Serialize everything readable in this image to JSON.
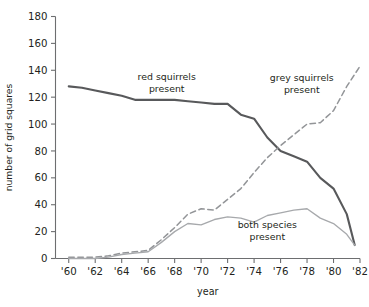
{
  "chart_data": {
    "type": "line",
    "title": "",
    "xlabel": "year",
    "ylabel": "number of grid squares",
    "xlim": [
      1959,
      1982
    ],
    "ylim": [
      0,
      180
    ],
    "grid": false,
    "legend_position": "inline-annotations",
    "x_tick_labels": [
      "'60",
      "'62",
      "'64",
      "'66",
      "'68",
      "'70",
      "'72",
      "'74",
      "'76",
      "'78",
      "'80",
      "'82"
    ],
    "x_tick_values": [
      1960,
      1962,
      1964,
      1966,
      1968,
      1970,
      1972,
      1974,
      1976,
      1978,
      1980,
      1982
    ],
    "y_tick_labels": [
      "0",
      "20",
      "40",
      "60",
      "80",
      "100",
      "120",
      "140",
      "160",
      "180"
    ],
    "y_tick_values": [
      0,
      20,
      40,
      60,
      80,
      100,
      120,
      140,
      160,
      180
    ],
    "series": [
      {
        "name": "red squirrels present",
        "style": "solid",
        "color": "#58595b",
        "x": [
          1960,
          1961,
          1962,
          1963,
          1964,
          1965,
          1966,
          1967,
          1968,
          1969,
          1970,
          1971,
          1972,
          1973,
          1974,
          1975,
          1976,
          1977,
          1978,
          1979,
          1980,
          1981,
          1981.6
        ],
        "values": [
          128,
          127,
          125,
          123,
          121,
          118,
          118,
          118,
          118,
          117,
          116,
          115,
          115,
          107,
          104,
          90,
          80,
          76,
          72,
          60,
          52,
          33,
          10
        ]
      },
      {
        "name": "grey squirrels present",
        "style": "dashed",
        "color": "#939598",
        "x": [
          1960,
          1962,
          1963,
          1964,
          1965,
          1966,
          1967,
          1968,
          1969,
          1970,
          1971,
          1972,
          1973,
          1974,
          1975,
          1976,
          1977,
          1978,
          1979,
          1980,
          1981,
          1982
        ],
        "values": [
          1,
          1,
          2,
          4,
          5,
          6,
          14,
          23,
          33,
          37,
          36,
          44,
          52,
          64,
          75,
          84,
          92,
          100,
          101,
          110,
          128,
          143
        ]
      },
      {
        "name": "both species present",
        "style": "solid",
        "color": "#a7a9ac",
        "x": [
          1960,
          1962,
          1963,
          1964,
          1965,
          1966,
          1967,
          1968,
          1969,
          1970,
          1971,
          1972,
          1973,
          1974,
          1975,
          1976,
          1977,
          1978,
          1979,
          1980,
          1981,
          1981.6
        ],
        "values": [
          0,
          0,
          1,
          3,
          4,
          5,
          12,
          20,
          26,
          25,
          29,
          31,
          30,
          27,
          32,
          34,
          36,
          37,
          30,
          26,
          18,
          10
        ]
      }
    ],
    "annotations": [
      {
        "label_line1": "red squirrels",
        "label_line2": "present",
        "x": 1967.4,
        "y": 133
      },
      {
        "label_line1": "grey squirrels",
        "label_line2": "present",
        "x": 1977.6,
        "y": 132
      },
      {
        "label_line1": "both species",
        "label_line2": "present",
        "x": 1975.0,
        "y": 23
      }
    ]
  },
  "axis": {
    "y_title": "number of grid squares",
    "x_title": "year"
  },
  "colors": {
    "red_series": "#58595b",
    "grey_series": "#939598",
    "both_series": "#a7a9ac",
    "axis": "#6d6e70",
    "text": "#231f20",
    "background": "#ffffff"
  }
}
